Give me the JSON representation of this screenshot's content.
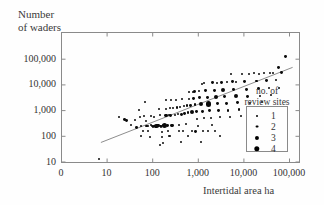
{
  "chart_data": {
    "type": "scatter",
    "title": "",
    "ylabel": "Number\nof waders",
    "xlabel": "Intertidal area ha",
    "xscale": "log",
    "yscale": "log",
    "xticklabels": [
      "0",
      "10",
      "100",
      "1,000",
      "10,000",
      "100,000"
    ],
    "yticklabels": [
      "10",
      "100",
      "1,000",
      "10,000",
      "100,000"
    ],
    "xlim": [
      1,
      1000000
    ],
    "ylim": [
      5,
      500000
    ],
    "grid": false,
    "legend": {
      "title": "no. of\nreview sites",
      "position": "inside-right",
      "entries": [
        {
          "label": "1",
          "size": 2.0
        },
        {
          "label": "2",
          "size": 2.9
        },
        {
          "label": "3",
          "size": 4.1
        },
        {
          "label": "4",
          "size": 5.4
        }
      ]
    },
    "trendline": {
      "type": "linear-fit-loglog",
      "x_start": 7.5,
      "y_start": 55,
      "x_end": 120000,
      "y_end": 46000,
      "color": "#8d8d8d"
    },
    "point_color": "#0a0a0a",
    "series": [
      {
        "name": "review sites",
        "points": [
          {
            "x": 6.8,
            "y": 13,
            "n": 1
          },
          {
            "x": 19,
            "y": 560,
            "n": 1
          },
          {
            "x": 25,
            "y": 420,
            "n": 2
          },
          {
            "x": 27,
            "y": 380,
            "n": 2
          },
          {
            "x": 34,
            "y": 260,
            "n": 1
          },
          {
            "x": 41,
            "y": 420,
            "n": 1
          },
          {
            "x": 46,
            "y": 215,
            "n": 2
          },
          {
            "x": 52,
            "y": 1050,
            "n": 1
          },
          {
            "x": 55,
            "y": 520,
            "n": 1
          },
          {
            "x": 58,
            "y": 250,
            "n": 1
          },
          {
            "x": 63,
            "y": 160,
            "n": 1
          },
          {
            "x": 66,
            "y": 600,
            "n": 1
          },
          {
            "x": 70,
            "y": 2100,
            "n": 1
          },
          {
            "x": 74,
            "y": 390,
            "n": 1
          },
          {
            "x": 76,
            "y": 240,
            "n": 2
          },
          {
            "x": 79,
            "y": 235,
            "n": 1
          },
          {
            "x": 82,
            "y": 155,
            "n": 1
          },
          {
            "x": 88,
            "y": 90,
            "n": 1
          },
          {
            "x": 92,
            "y": 600,
            "n": 1
          },
          {
            "x": 96,
            "y": 270,
            "n": 1
          },
          {
            "x": 100,
            "y": 250,
            "n": 1
          },
          {
            "x": 104,
            "y": 230,
            "n": 2
          },
          {
            "x": 110,
            "y": 560,
            "n": 1
          },
          {
            "x": 112,
            "y": 240,
            "n": 2
          },
          {
            "x": 118,
            "y": 235,
            "n": 2
          },
          {
            "x": 124,
            "y": 240,
            "n": 3
          },
          {
            "x": 130,
            "y": 245,
            "n": 2
          },
          {
            "x": 136,
            "y": 250,
            "n": 2
          },
          {
            "x": 140,
            "y": 1100,
            "n": 1
          },
          {
            "x": 145,
            "y": 620,
            "n": 1
          },
          {
            "x": 150,
            "y": 240,
            "n": 2
          },
          {
            "x": 156,
            "y": 235,
            "n": 2
          },
          {
            "x": 162,
            "y": 145,
            "n": 1
          },
          {
            "x": 168,
            "y": 92,
            "n": 1
          },
          {
            "x": 172,
            "y": 52,
            "n": 1
          },
          {
            "x": 178,
            "y": 245,
            "n": 2
          },
          {
            "x": 185,
            "y": 250,
            "n": 4
          },
          {
            "x": 192,
            "y": 600,
            "n": 2
          },
          {
            "x": 198,
            "y": 1150,
            "n": 1
          },
          {
            "x": 205,
            "y": 640,
            "n": 2
          },
          {
            "x": 212,
            "y": 255,
            "n": 2
          },
          {
            "x": 220,
            "y": 150,
            "n": 1
          },
          {
            "x": 228,
            "y": 95,
            "n": 1
          },
          {
            "x": 236,
            "y": 620,
            "n": 1
          },
          {
            "x": 244,
            "y": 1200,
            "n": 1
          },
          {
            "x": 255,
            "y": 630,
            "n": 2
          },
          {
            "x": 265,
            "y": 260,
            "n": 2
          },
          {
            "x": 275,
            "y": 255,
            "n": 2
          },
          {
            "x": 290,
            "y": 1250,
            "n": 1
          },
          {
            "x": 310,
            "y": 650,
            "n": 1
          },
          {
            "x": 330,
            "y": 2400,
            "n": 1
          },
          {
            "x": 350,
            "y": 1300,
            "n": 2
          },
          {
            "x": 370,
            "y": 680,
            "n": 1
          },
          {
            "x": 390,
            "y": 270,
            "n": 1
          },
          {
            "x": 410,
            "y": 1350,
            "n": 1
          },
          {
            "x": 430,
            "y": 700,
            "n": 2
          },
          {
            "x": 460,
            "y": 2600,
            "n": 1
          },
          {
            "x": 490,
            "y": 1400,
            "n": 1
          },
          {
            "x": 520,
            "y": 760,
            "n": 2
          },
          {
            "x": 550,
            "y": 290,
            "n": 1
          },
          {
            "x": 580,
            "y": 1500,
            "n": 2
          },
          {
            "x": 610,
            "y": 800,
            "n": 2
          },
          {
            "x": 650,
            "y": 2800,
            "n": 1
          },
          {
            "x": 690,
            "y": 1550,
            "n": 2
          },
          {
            "x": 730,
            "y": 820,
            "n": 3
          },
          {
            "x": 780,
            "y": 5200,
            "n": 1
          },
          {
            "x": 820,
            "y": 2900,
            "n": 2
          },
          {
            "x": 870,
            "y": 1600,
            "n": 2
          },
          {
            "x": 920,
            "y": 860,
            "n": 2
          },
          {
            "x": 980,
            "y": 450,
            "n": 1
          },
          {
            "x": 1000,
            "y": 240,
            "n": 1
          },
          {
            "x": 1050,
            "y": 5400,
            "n": 1
          },
          {
            "x": 1100,
            "y": 3000,
            "n": 2
          },
          {
            "x": 1150,
            "y": 1700,
            "n": 3
          },
          {
            "x": 1250,
            "y": 900,
            "n": 2
          },
          {
            "x": 1350,
            "y": 480,
            "n": 1
          },
          {
            "x": 1400,
            "y": 11000,
            "n": 1
          },
          {
            "x": 1500,
            "y": 5600,
            "n": 2
          },
          {
            "x": 1600,
            "y": 3100,
            "n": 2
          },
          {
            "x": 1700,
            "y": 1750,
            "n": 4
          },
          {
            "x": 1800,
            "y": 950,
            "n": 2
          },
          {
            "x": 1900,
            "y": 500,
            "n": 1
          },
          {
            "x": 2000,
            "y": 270,
            "n": 1
          },
          {
            "x": 2100,
            "y": 11500,
            "n": 2
          },
          {
            "x": 2300,
            "y": 5800,
            "n": 2
          },
          {
            "x": 2500,
            "y": 3200,
            "n": 3
          },
          {
            "x": 2700,
            "y": 1800,
            "n": 2
          },
          {
            "x": 2900,
            "y": 980,
            "n": 2
          },
          {
            "x": 3100,
            "y": 520,
            "n": 1
          },
          {
            "x": 3300,
            "y": 12000,
            "n": 2
          },
          {
            "x": 3600,
            "y": 6000,
            "n": 3
          },
          {
            "x": 3900,
            "y": 3300,
            "n": 2
          },
          {
            "x": 4200,
            "y": 1850,
            "n": 2
          },
          {
            "x": 4600,
            "y": 1000,
            "n": 2
          },
          {
            "x": 5000,
            "y": 540,
            "n": 1
          },
          {
            "x": 5400,
            "y": 25000,
            "n": 1
          },
          {
            "x": 5800,
            "y": 12500,
            "n": 2
          },
          {
            "x": 6200,
            "y": 6200,
            "n": 2
          },
          {
            "x": 6800,
            "y": 3400,
            "n": 3
          },
          {
            "x": 7400,
            "y": 1900,
            "n": 2
          },
          {
            "x": 8000,
            "y": 1050,
            "n": 2
          },
          {
            "x": 8800,
            "y": 580,
            "n": 1
          },
          {
            "x": 9500,
            "y": 26000,
            "n": 1
          },
          {
            "x": 10500,
            "y": 13000,
            "n": 2
          },
          {
            "x": 11500,
            "y": 6500,
            "n": 2
          },
          {
            "x": 12500,
            "y": 3500,
            "n": 2
          },
          {
            "x": 14000,
            "y": 1950,
            "n": 1
          },
          {
            "x": 15500,
            "y": 1100,
            "n": 1
          },
          {
            "x": 17000,
            "y": 27000,
            "n": 1
          },
          {
            "x": 19000,
            "y": 13500,
            "n": 2
          },
          {
            "x": 21000,
            "y": 6800,
            "n": 2
          },
          {
            "x": 23000,
            "y": 3600,
            "n": 1
          },
          {
            "x": 26000,
            "y": 2000,
            "n": 1
          },
          {
            "x": 29000,
            "y": 28000,
            "n": 1
          },
          {
            "x": 32000,
            "y": 14000,
            "n": 2
          },
          {
            "x": 36000,
            "y": 7000,
            "n": 1
          },
          {
            "x": 40000,
            "y": 3700,
            "n": 1
          },
          {
            "x": 45000,
            "y": 29000,
            "n": 1
          },
          {
            "x": 52000,
            "y": 15000,
            "n": 1
          },
          {
            "x": 60000,
            "y": 7200,
            "n": 1
          },
          {
            "x": 70000,
            "y": 30000,
            "n": 2
          },
          {
            "x": 85000,
            "y": 120000,
            "n": 2
          },
          {
            "x": 1300,
            "y": 160,
            "n": 1
          },
          {
            "x": 1700,
            "y": 150,
            "n": 1
          },
          {
            "x": 2400,
            "y": 160,
            "n": 1
          },
          {
            "x": 3000,
            "y": 95,
            "n": 1
          },
          {
            "x": 900,
            "y": 150,
            "n": 2
          },
          {
            "x": 760,
            "y": 160,
            "n": 1
          },
          {
            "x": 620,
            "y": 95,
            "n": 1
          },
          {
            "x": 470,
            "y": 150,
            "n": 1
          },
          {
            "x": 380,
            "y": 155,
            "n": 1
          },
          {
            "x": 200,
            "y": 2500,
            "n": 1
          },
          {
            "x": 260,
            "y": 2550,
            "n": 1
          },
          {
            "x": 640,
            "y": 5000,
            "n": 1
          },
          {
            "x": 860,
            "y": 5100,
            "n": 2
          },
          {
            "x": 1250,
            "y": 10500,
            "n": 1
          },
          {
            "x": 2600,
            "y": 11800,
            "n": 1
          },
          {
            "x": 4400,
            "y": 12200,
            "n": 1
          },
          {
            "x": 7000,
            "y": 12800,
            "n": 1
          },
          {
            "x": 13000,
            "y": 25500,
            "n": 1
          },
          {
            "x": 22000,
            "y": 26500,
            "n": 1
          },
          {
            "x": 38000,
            "y": 28500,
            "n": 1
          },
          {
            "x": 58000,
            "y": 45000,
            "n": 2
          },
          {
            "x": 150,
            "y": 45,
            "n": 1
          },
          {
            "x": 420,
            "y": 55,
            "n": 1
          },
          {
            "x": 1150,
            "y": 60,
            "n": 1
          },
          {
            "x": 56,
            "y": 95,
            "n": 1
          },
          {
            "x": 240,
            "y": 100,
            "n": 1
          }
        ]
      }
    ]
  }
}
